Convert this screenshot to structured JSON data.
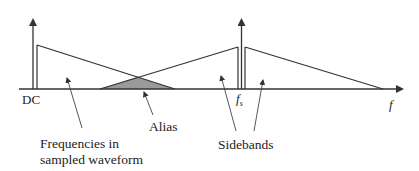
{
  "diagram": {
    "colors": {
      "line": "#333333",
      "alias_fill": "#9a9a9a",
      "text": "#222222",
      "background": "#ffffff"
    },
    "labels": {
      "dc": "DC",
      "fs_main": "f",
      "fs_sub": "s",
      "f_axis": "f",
      "alias": "Alias",
      "frequencies_line1": "Frequencies in",
      "frequencies_line2": "sampled waveform",
      "sidebands": "Sidebands"
    },
    "elements": {
      "axis": "frequency axis with arrow",
      "dc_spike": "DC spectral line",
      "fs_spike": "sampling frequency spectral line",
      "baseband": "baseband spectrum triangle",
      "lower_sideband": "lower sideband around fs",
      "upper_sideband": "upper sideband around fs",
      "alias_region": "overlapping alias region (shaded)"
    }
  }
}
